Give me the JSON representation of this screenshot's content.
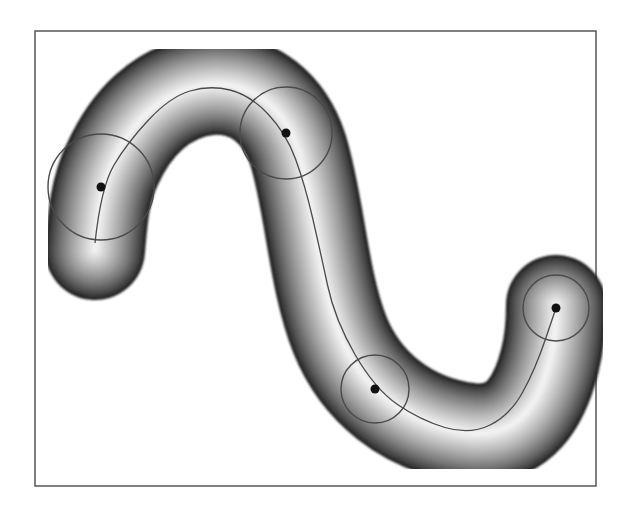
{
  "figure": {
    "kind": "tubular shape with medial axis and sample disks",
    "frame": {
      "x": 35,
      "y": 31,
      "width": 561,
      "height": 455,
      "stroke": "#555555"
    },
    "colors": {
      "background": "#ffffff",
      "tube_edge": "#1e1e1e",
      "tube_center": "#f2f2f2",
      "axis_line": "#4a4a4a",
      "circle_stroke": "#4a4a4a",
      "dot": "#111111"
    },
    "medial_axis_points": [
      [
        95,
        243
      ],
      [
        101,
        187
      ],
      [
        127,
        143
      ],
      [
        170,
        97
      ],
      [
        210,
        85
      ],
      [
        250,
        95
      ],
      [
        286,
        133
      ],
      [
        305,
        185
      ],
      [
        320,
        250
      ],
      [
        335,
        320
      ],
      [
        375,
        389
      ],
      [
        420,
        420
      ],
      [
        470,
        435
      ],
      [
        510,
        415
      ],
      [
        535,
        370
      ],
      [
        556,
        308
      ]
    ],
    "tube_path": "M 95 250 C 98 215, 100 190, 112 165 C 130 125, 160 90, 210 85 C 255 82, 285 110, 298 150 C 315 205, 318 280, 340 335 C 360 385, 405 425, 470 433 C 520 438, 540 400, 550 360 C 555 340, 556 320, 556 305",
    "tube_width": 100,
    "disks": [
      {
        "cx": 101,
        "cy": 187,
        "r": 53,
        "dot_r": 4.5
      },
      {
        "cx": 286,
        "cy": 133,
        "r": 46,
        "dot_r": 4.5
      },
      {
        "cx": 375,
        "cy": 389,
        "r": 34,
        "dot_r": 4.5
      },
      {
        "cx": 556,
        "cy": 308,
        "r": 33,
        "dot_r": 4.5
      }
    ]
  }
}
